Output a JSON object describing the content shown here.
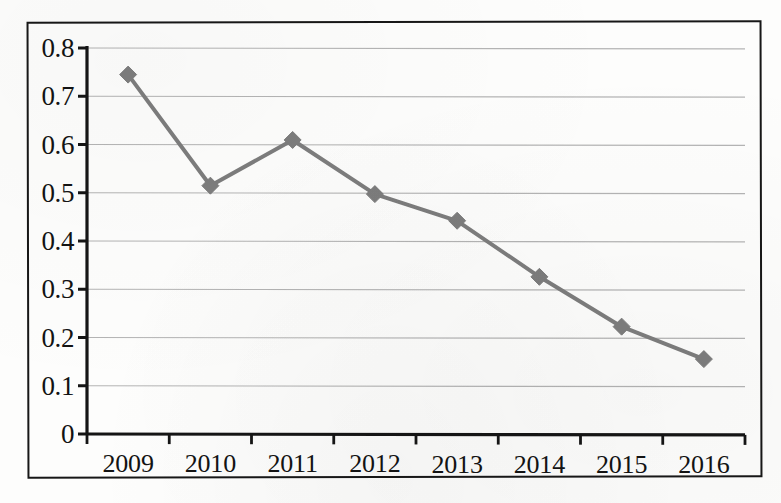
{
  "chart_data": {
    "type": "line",
    "title": "",
    "subtitle": "",
    "xlabel": "",
    "ylabel": "",
    "categories": [
      "2009",
      "2010",
      "2011",
      "2012",
      "2013",
      "2014",
      "2015",
      "2016"
    ],
    "series": [
      {
        "name": "",
        "values": [
          0.745,
          0.515,
          0.61,
          0.498,
          0.443,
          0.327,
          0.224,
          0.157
        ],
        "color": "#7d7d7d",
        "marker": "diamond",
        "line_width": 4
      }
    ],
    "ylim": [
      0,
      0.8
    ],
    "yticks": [
      0,
      0.1,
      0.2,
      0.3,
      0.4,
      0.5,
      0.6,
      0.7,
      0.8
    ],
    "ytick_labels": [
      "0",
      "0.1",
      "0.2",
      "0.3",
      "0.4",
      "0.5",
      "0.6",
      "0.7",
      "0.8"
    ],
    "grid": "horizontal",
    "grid_color": "#b4b4b4",
    "legend": "none",
    "axis_color": "#151515",
    "frame_color": "#171717",
    "background": "#fdfdfc",
    "annotations": []
  }
}
